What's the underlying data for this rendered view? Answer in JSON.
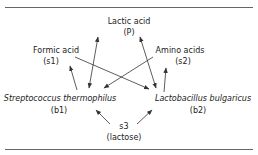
{
  "nodes": {
    "product": {
      "name": "Lactic acid",
      "symbol": "(P)"
    },
    "s1": {
      "name": "Formic acid",
      "symbol": "(s1)"
    },
    "s2": {
      "name": "Amino acids",
      "symbol": "(s2)"
    },
    "b1": {
      "name": "Streptococcus thermophilus",
      "symbol": "(b1)"
    },
    "b2": {
      "name": "Lactobacillus bulgaricus",
      "symbol": "(b2)"
    },
    "s3": {
      "name": "s3",
      "symbol": "(lactose)"
    }
  },
  "edges": [
    {
      "from": "b1",
      "to": "s1",
      "type": "arrow"
    },
    {
      "from": "b1",
      "to": "product",
      "type": "bidirectional"
    },
    {
      "from": "s1",
      "to": "b2",
      "type": "arrow"
    },
    {
      "from": "s2",
      "to": "b1",
      "type": "arrow"
    },
    {
      "from": "b2",
      "to": "product",
      "type": "bidirectional"
    },
    {
      "from": "b2",
      "to": "s2",
      "type": "arrow"
    },
    {
      "from": "s3",
      "to": "b1",
      "type": "arrow"
    },
    {
      "from": "s3",
      "to": "b2",
      "type": "arrow"
    }
  ],
  "colors": {
    "line": "#333333",
    "rule": "#666666",
    "text": "#222222"
  }
}
